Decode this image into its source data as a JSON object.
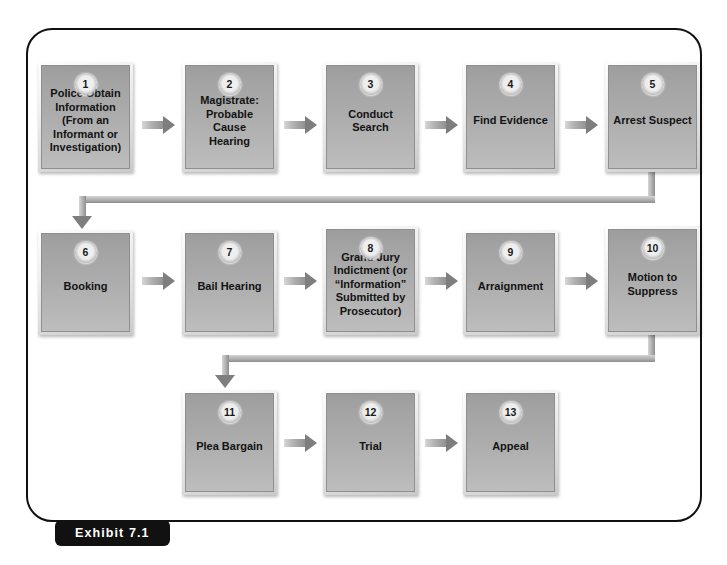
{
  "exhibit": {
    "label": "Exhibit 7.1"
  },
  "colors": {
    "frame_border": "#111111",
    "exhibit_pill_bg": "#111111",
    "exhibit_pill_text": "#ffffff",
    "box_fill_top": "#9d9d9d",
    "box_fill_bottom": "#bdbdbd",
    "box_bevel": "#efefef",
    "arrow": "#8f8f8f",
    "text": "#131313",
    "page_bg": "#ffffff"
  },
  "diagram": {
    "type": "flowchart",
    "orientation": "left-to-right, serpentine rows",
    "nodes": [
      {
        "number": "1",
        "label": "Police Obtain\nInformation\n(From an\nInformant or\nInvestigation)",
        "row": 1,
        "col": 1
      },
      {
        "number": "2",
        "label": "Magistrate:\nProbable Cause\nHearing",
        "row": 1,
        "col": 2
      },
      {
        "number": "3",
        "label": "Conduct Search",
        "row": 1,
        "col": 3
      },
      {
        "number": "4",
        "label": "Find Evidence",
        "row": 1,
        "col": 4
      },
      {
        "number": "5",
        "label": "Arrest Suspect",
        "row": 1,
        "col": 5
      },
      {
        "number": "6",
        "label": "Booking",
        "row": 2,
        "col": 1
      },
      {
        "number": "7",
        "label": "Bail Hearing",
        "row": 2,
        "col": 2
      },
      {
        "number": "8",
        "label": "Grand Jury\nIndictment (or\n“Information”\nSubmitted by\nProsecutor)",
        "row": 2,
        "col": 3
      },
      {
        "number": "9",
        "label": "Arraignment",
        "row": 2,
        "col": 4
      },
      {
        "number": "10",
        "label": "Motion to\nSuppress",
        "row": 2,
        "col": 5
      },
      {
        "number": "11",
        "label": "Plea Bargain",
        "row": 3,
        "col": 2
      },
      {
        "number": "12",
        "label": "Trial",
        "row": 3,
        "col": 3
      },
      {
        "number": "13",
        "label": "Appeal",
        "row": 3,
        "col": 4
      }
    ],
    "edges": [
      {
        "from": "1",
        "to": "2",
        "style": "arrow-right"
      },
      {
        "from": "2",
        "to": "3",
        "style": "arrow-right"
      },
      {
        "from": "3",
        "to": "4",
        "style": "arrow-right"
      },
      {
        "from": "4",
        "to": "5",
        "style": "arrow-right"
      },
      {
        "from": "5",
        "to": "6",
        "style": "elbow-wrap-down"
      },
      {
        "from": "6",
        "to": "7",
        "style": "arrow-right"
      },
      {
        "from": "7",
        "to": "8",
        "style": "arrow-right"
      },
      {
        "from": "8",
        "to": "9",
        "style": "arrow-right"
      },
      {
        "from": "9",
        "to": "10",
        "style": "arrow-right"
      },
      {
        "from": "10",
        "to": "11",
        "style": "elbow-wrap-down"
      },
      {
        "from": "11",
        "to": "12",
        "style": "arrow-right"
      },
      {
        "from": "12",
        "to": "13",
        "style": "arrow-right"
      }
    ]
  }
}
